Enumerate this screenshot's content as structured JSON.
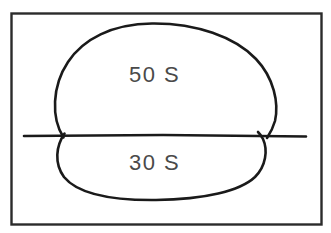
{
  "figure": {
    "type": "technical-sketch",
    "frame": {
      "stroke_color": "#2b2b2b",
      "background_color": "#ffffff"
    },
    "labels": {
      "upper": "50 S",
      "lower": "30 S"
    },
    "annotations": {
      "upper_region_name": "upper-oval",
      "lower_region_name": "lower-oval",
      "divider_name": "horizontal-centerline"
    },
    "colors": {
      "ink": "#1a1a1a",
      "text": "#4a4a4a",
      "frame": "#2b2b2b",
      "paper": "#ffffff"
    }
  }
}
